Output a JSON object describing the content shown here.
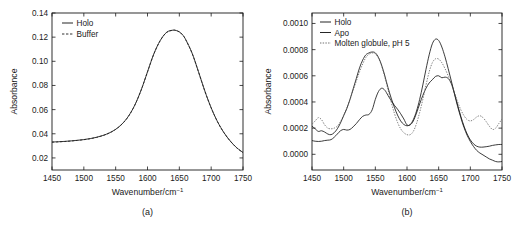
{
  "figure": {
    "panels": [
      {
        "id": "a",
        "panel_label": "(a)",
        "xlabel_main": "Wavenumber/cm",
        "xlabel_sup": "−1",
        "ylabel": "Absorbance",
        "legend": [
          {
            "label": "Holo",
            "style": "solid"
          },
          {
            "label": "Buffer",
            "style": "dashed"
          }
        ]
      },
      {
        "id": "b",
        "panel_label": "(b)",
        "xlabel_main": "Wavenumber/cm",
        "xlabel_sup": "−1",
        "ylabel": "Absorbance",
        "legend": [
          {
            "label": "Holo",
            "style": "solid"
          },
          {
            "label": "Apo",
            "style": "solid"
          },
          {
            "label": "Molten globule, pH 5",
            "style": "dotted"
          }
        ]
      }
    ]
  },
  "chart_data": [
    {
      "type": "line",
      "panel": "a",
      "title": "",
      "xlabel": "Wavenumber/cm−1",
      "ylabel": "Absorbance",
      "xlim": [
        1450,
        1750
      ],
      "ylim": [
        0.01,
        0.14
      ],
      "xticks": [
        1450,
        1500,
        1550,
        1600,
        1650,
        1700,
        1750
      ],
      "yticks": [
        0.02,
        0.04,
        0.06,
        0.08,
        0.1,
        0.12,
        0.14
      ],
      "ytick_labels": [
        "0.02",
        "0.04",
        "0.06",
        "0.08",
        "0.10",
        "0.12",
        "0.14"
      ],
      "xtick_labels": [
        "1450",
        "1500",
        "1550",
        "1600",
        "1650",
        "1700",
        "1750"
      ],
      "grid": false,
      "legend_position": "top-left",
      "x": [
        1450,
        1460,
        1470,
        1480,
        1490,
        1500,
        1510,
        1520,
        1530,
        1540,
        1550,
        1560,
        1570,
        1580,
        1590,
        1600,
        1610,
        1620,
        1630,
        1640,
        1645,
        1650,
        1655,
        1660,
        1670,
        1680,
        1690,
        1700,
        1710,
        1720,
        1730,
        1740,
        1750
      ],
      "series": [
        {
          "name": "Holo",
          "style": "solid",
          "values": [
            0.0332,
            0.0334,
            0.0337,
            0.0341,
            0.0346,
            0.0352,
            0.036,
            0.0371,
            0.0386,
            0.0407,
            0.0437,
            0.0481,
            0.0545,
            0.0637,
            0.0762,
            0.0913,
            0.1062,
            0.1172,
            0.124,
            0.1258,
            0.1255,
            0.1244,
            0.122,
            0.118,
            0.1068,
            0.0915,
            0.0755,
            0.0615,
            0.05,
            0.041,
            0.034,
            0.0285,
            0.0245
          ]
        },
        {
          "name": "Buffer",
          "style": "dashed",
          "values": [
            0.033,
            0.0333,
            0.0336,
            0.034,
            0.0345,
            0.0351,
            0.0359,
            0.037,
            0.0385,
            0.0406,
            0.0436,
            0.048,
            0.0544,
            0.0636,
            0.0761,
            0.0912,
            0.1061,
            0.1171,
            0.1239,
            0.1257,
            0.1254,
            0.1243,
            0.1219,
            0.1179,
            0.1067,
            0.0914,
            0.0754,
            0.0614,
            0.0499,
            0.0409,
            0.0339,
            0.0284,
            0.0244
          ]
        }
      ]
    },
    {
      "type": "line",
      "panel": "b",
      "title": "",
      "xlabel": "Wavenumber/cm−1",
      "ylabel": "Absorbance",
      "xlim": [
        1450,
        1750
      ],
      "ylim": [
        -0.00012,
        0.00108
      ],
      "xticks": [
        1450,
        1500,
        1550,
        1600,
        1650,
        1700,
        1750
      ],
      "yticks": [
        0.0,
        0.0002,
        0.0004,
        0.0006,
        0.0008,
        0.001
      ],
      "ytick_labels": [
        "0.0000",
        "0.0002",
        "0.0004",
        "0.0006",
        "0.0008",
        "0.0010"
      ],
      "xtick_labels": [
        "1450",
        "1500",
        "1550",
        "1600",
        "1650",
        "1700",
        "1750"
      ],
      "grid": false,
      "legend_position": "top-left",
      "x": [
        1450,
        1455,
        1460,
        1465,
        1470,
        1475,
        1480,
        1485,
        1490,
        1495,
        1500,
        1505,
        1510,
        1515,
        1520,
        1525,
        1530,
        1535,
        1540,
        1545,
        1550,
        1555,
        1560,
        1565,
        1570,
        1575,
        1580,
        1585,
        1590,
        1595,
        1600,
        1605,
        1610,
        1615,
        1620,
        1625,
        1630,
        1635,
        1640,
        1645,
        1650,
        1655,
        1660,
        1665,
        1670,
        1675,
        1680,
        1685,
        1690,
        1695,
        1700,
        1705,
        1710,
        1715,
        1720,
        1725,
        1730,
        1735,
        1740,
        1745,
        1750
      ],
      "series": [
        {
          "name": "Holo",
          "style": "solid",
          "values": [
            0.000215,
            0.000195,
            0.000175,
            0.00018,
            0.00017,
            0.000155,
            0.00015,
            0.000165,
            0.000195,
            0.00024,
            0.000295,
            0.00035,
            0.00042,
            0.0005,
            0.00058,
            0.00066,
            0.00072,
            0.00076,
            0.000775,
            0.000782,
            0.000775,
            0.00074,
            0.00068,
            0.0006,
            0.00051,
            0.00043,
            0.00036,
            0.0003,
            0.000255,
            0.000228,
            0.000218,
            0.000228,
            0.000265,
            0.00033,
            0.00042,
            0.00053,
            0.00065,
            0.00076,
            0.000845,
            0.00088,
            0.00087,
            0.00082,
            0.000745,
            0.000655,
            0.00056,
            0.00046,
            0.000365,
            0.00028,
            0.000205,
            0.000145,
            9.8e-05,
            6e-05,
            3e-05,
            1e-05,
            -5e-06,
            -2e-05,
            -3.5e-05,
            -4.5e-05,
            -5.5e-05,
            -5.8e-05,
            -5.5e-05
          ]
        },
        {
          "name": "Apo",
          "style": "solid",
          "values": [
            0.000105,
            0.0001,
            9.8e-05,
            0.0001,
            0.000105,
            0.000108,
            0.000112,
            0.00013,
            0.000155,
            0.00018,
            0.00019,
            0.000185,
            0.00019,
            0.00021,
            0.000235,
            0.000265,
            0.00029,
            0.0003,
            0.000305,
            0.00034,
            0.00042,
            0.00048,
            0.000505,
            0.00049,
            0.00045,
            0.00041,
            0.000375,
            0.000345,
            0.00031,
            0.00027,
            0.000225,
            0.000225,
            0.000255,
            0.000315,
            0.000385,
            0.00045,
            0.000505,
            0.000545,
            0.00057,
            0.000595,
            0.0006,
            0.000585,
            0.00059,
            0.00058,
            0.00054,
            0.000465,
            0.000375,
            0.00029,
            0.000215,
            0.000155,
            0.00011,
            8e-05,
            6.2e-05,
            5.5e-05,
            5.5e-05,
            5.8e-05,
            6.2e-05,
            6.8e-05,
            7.2e-05,
            7.5e-05,
            7.5e-05
          ]
        },
        {
          "name": "Molten globule, pH 5",
          "style": "dotted",
          "values": [
            0.00023,
            0.000255,
            0.00028,
            0.000265,
            0.000225,
            0.0002,
            0.000195,
            0.0002,
            0.000215,
            0.00025,
            0.0003,
            0.000355,
            0.00042,
            0.00049,
            0.00056,
            0.00063,
            0.00069,
            0.00074,
            0.000765,
            0.000775,
            0.000768,
            0.000735,
            0.000675,
            0.00059,
            0.000495,
            0.0004,
            0.000315,
            0.000245,
            0.000195,
            0.000165,
            0.00015,
            0.00015,
            0.000175,
            0.000235,
            0.00032,
            0.00042,
            0.00053,
            0.00063,
            0.0007,
            0.00073,
            0.000728,
            0.0007,
            0.000655,
            0.0006,
            0.00054,
            0.00047,
            0.0004,
            0.00034,
            0.000295,
            0.000265,
            0.000255,
            0.000265,
            0.000285,
            0.000295,
            0.00028,
            0.00025,
            0.000215,
            0.00019,
            0.0002,
            0.000235,
            0.00027
          ]
        }
      ]
    }
  ]
}
